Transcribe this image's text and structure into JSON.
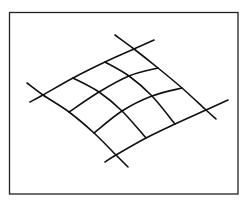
{
  "figure": {
    "stroke_color": "#111111",
    "frame_color": "#222222",
    "background": "#ffffff",
    "frame": {
      "x": 9.5,
      "y": 12.5,
      "width": 228.5,
      "height": 181.5
    },
    "nodes": [
      [
        [
          43,
          95
        ],
        [
          73,
          78
        ],
        [
          105,
          62
        ],
        [
          134,
          49
        ]
      ],
      [
        [
          69,
          112
        ],
        [
          99,
          92
        ],
        [
          129,
          76
        ],
        [
          158,
          68
        ]
      ],
      [
        [
          94,
          133
        ],
        [
          122,
          111
        ],
        [
          152,
          96
        ],
        [
          182,
          88
        ]
      ],
      [
        [
          116,
          155
        ],
        [
          146,
          138
        ],
        [
          175,
          124
        ],
        [
          206,
          110
        ]
      ]
    ],
    "edge_extensions": {
      "top_edge": {
        "start": [
          30,
          102
        ],
        "end": [
          154,
          40
        ]
      },
      "bottom_edge": {
        "start": [
          105,
          162
        ],
        "end": [
          228,
          100
        ]
      },
      "left_edge": {
        "start": [
          27,
          83
        ],
        "end": [
          128,
          167
        ]
      },
      "right_edge": {
        "start": [
          115,
          35
        ],
        "end": [
          216,
          119
        ]
      }
    }
  }
}
